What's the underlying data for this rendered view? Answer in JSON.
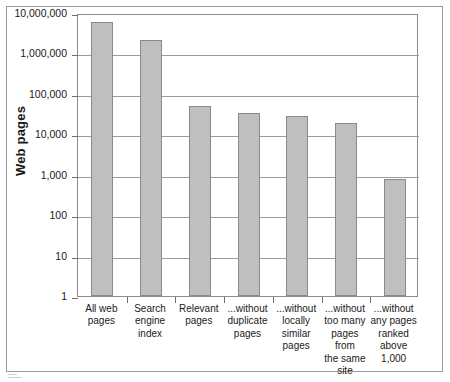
{
  "chart_data": {
    "type": "bar",
    "title": "",
    "subtitle": "",
    "xlabel": "",
    "ylabel": "Web pages",
    "yscale": "log",
    "ylim": [
      1,
      10000000
    ],
    "grid": true,
    "legend": false,
    "legend_position": "none",
    "categories": [
      "All web\npages",
      "Search\nengine\nindex",
      "Relevant\npages",
      "...without\nduplicate\npages",
      "...without\nlocally\nsimilar\npages",
      "...without\ntoo many\npages from\nthe same\nsite",
      "...without\nany pages\nranked\nabove\n1,000"
    ],
    "values": [
      6000000,
      2100000,
      50000,
      34000,
      28000,
      19000,
      800
    ],
    "ytick_labels": [
      "10,000,000",
      "1,000,000",
      "100,000",
      "10,000",
      "1,000",
      "100",
      "10",
      "1"
    ],
    "ytick_values": [
      10000000,
      1000000,
      100000,
      10000,
      1000,
      100,
      10,
      1
    ],
    "series": [
      {
        "name": "Web pages",
        "values": [
          6000000,
          2100000,
          50000,
          34000,
          28000,
          19000,
          800
        ]
      }
    ],
    "colors": {
      "bar_fill": "#bfbfbf",
      "bar_border": "#8a8a8a",
      "gridline": "#9b9b9b",
      "axis": "#8c8c8c",
      "text": "#1a1a1a",
      "background": "#ffffff"
    }
  }
}
